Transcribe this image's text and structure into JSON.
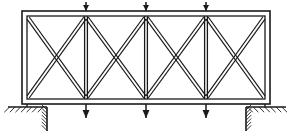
{
  "figure": {
    "domain": "diagram",
    "kind": "structural-truss-elevation",
    "title": "",
    "background_color": "#ffffff",
    "line_color": "#1a1a1a",
    "canvas": {
      "width": 293,
      "height": 136
    }
  },
  "frame": {
    "name": "outer-chord-frame",
    "outer": {
      "x": 22,
      "y": 11,
      "width": 248,
      "height": 93
    },
    "inner": {
      "x": 27,
      "y": 16,
      "width": 238,
      "height": 83
    },
    "stroke_width": 1.6,
    "double_line": true
  },
  "chords": {
    "top_outer_y": 11,
    "top_inner_y": 16,
    "bottom_inner_y": 99,
    "bottom_outer_y": 104,
    "left_outer_x": 22,
    "left_inner_x": 27,
    "right_inner_x": 265,
    "right_outer_x": 270
  },
  "verticals": {
    "count": 3,
    "x_positions": [
      86,
      146,
      206
    ],
    "top_y": 16,
    "bottom_y": 99,
    "stroke_width": 1.3,
    "double_line": true,
    "offset": 1.4
  },
  "panels": {
    "count": 4,
    "bounds_x": [
      27,
      86,
      146,
      206,
      265
    ],
    "top_y": 17,
    "bottom_y": 98,
    "bracing": "double-diagonal-X",
    "diagonal_stroke_width": 1.2,
    "diagonal_offset": 2.2
  },
  "loads": {
    "symbol": "downward-arrowhead",
    "top": {
      "label": "top-chord-point-loads",
      "x_positions": [
        86,
        146,
        206
      ],
      "tip_y": 11,
      "tail_y": 2,
      "head_width": 6,
      "head_height": 6
    },
    "bottom": {
      "label": "bottom-chord-point-loads",
      "x_positions": [
        86,
        146,
        206
      ],
      "tip_y": 118,
      "tail_y": 104,
      "head_width": 7,
      "head_height": 8
    }
  },
  "supports": [
    {
      "name": "support-left",
      "type": "fixed-hatched-ground",
      "ground_line": {
        "x1": 8,
        "x2": 47,
        "y": 107
      },
      "wall_line": {
        "x": 47,
        "y1": 107,
        "y2": 131
      },
      "hatch_count_horizontal": 7,
      "hatch_count_vertical": 7,
      "hatch_direction": "left-down"
    },
    {
      "name": "support-right",
      "type": "fixed-hatched-ground",
      "ground_line": {
        "x1": 246,
        "x2": 286,
        "y": 107
      },
      "wall_line": {
        "x": 246,
        "y1": 107,
        "y2": 131
      },
      "hatch_count_horizontal": 7,
      "hatch_count_vertical": 7,
      "hatch_direction": "right-down"
    }
  ],
  "base_connectors": {
    "left": {
      "x": 27,
      "y1": 104,
      "y2": 107
    },
    "right": {
      "x": 265,
      "y1": 104,
      "y2": 107
    }
  },
  "annotations": [],
  "legend": null
}
